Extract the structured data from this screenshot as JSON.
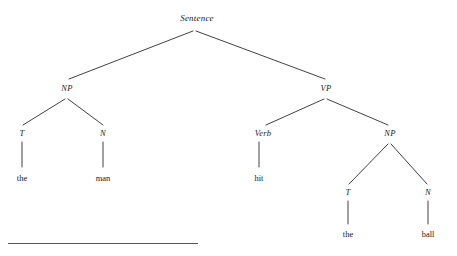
{
  "diagram": {
    "type": "syntax-tree",
    "title_node": "Sentence",
    "background_color": "#ffffff",
    "line_color": "#2b2b2b",
    "text_color": "#1a1a1a",
    "sentence_text": "the man hit the ball",
    "nodes": [
      {
        "id": "sentence",
        "label": "Sentence",
        "x": 197,
        "y": 18,
        "kind": "nonterminal"
      },
      {
        "id": "np1",
        "label": "NP",
        "x": 67,
        "y": 88,
        "kind": "nonterminal"
      },
      {
        "id": "vp",
        "label": "VP",
        "x": 326,
        "y": 88,
        "kind": "nonterminal"
      },
      {
        "id": "t1",
        "label": "T",
        "x": 22,
        "y": 133,
        "kind": "nonterminal"
      },
      {
        "id": "n1",
        "label": "N",
        "x": 103,
        "y": 133,
        "kind": "nonterminal"
      },
      {
        "id": "verb",
        "label": "Verb",
        "x": 263,
        "y": 133,
        "kind": "nonterminal"
      },
      {
        "id": "np2",
        "label": "NP",
        "x": 390,
        "y": 133,
        "kind": "nonterminal"
      },
      {
        "id": "t2",
        "label": "T",
        "x": 348,
        "y": 192,
        "kind": "nonterminal"
      },
      {
        "id": "n2",
        "label": "N",
        "x": 428,
        "y": 192,
        "kind": "nonterminal"
      }
    ],
    "terminals": [
      {
        "id": "word-the-1",
        "label": "the",
        "x": 22,
        "y": 178
      },
      {
        "id": "word-man",
        "label": "man",
        "x": 103,
        "y": 178
      },
      {
        "id": "word-hit",
        "label": "hit",
        "x": 259,
        "y": 178
      },
      {
        "id": "word-the-2",
        "label": "the",
        "x": 348,
        "y": 234
      },
      {
        "id": "word-ball",
        "label": "ball",
        "x": 428,
        "y": 234
      }
    ],
    "edges": [
      {
        "from": "sentence",
        "to": "np1",
        "x1": 193,
        "y1": 31,
        "x2": 69,
        "y2": 79
      },
      {
        "from": "sentence",
        "to": "vp",
        "x1": 196,
        "y1": 31,
        "x2": 325,
        "y2": 79
      },
      {
        "from": "np1",
        "to": "t1",
        "x1": 65,
        "y1": 99,
        "x2": 23,
        "y2": 125
      },
      {
        "from": "np1",
        "to": "n1",
        "x1": 68,
        "y1": 99,
        "x2": 103,
        "y2": 125
      },
      {
        "from": "vp",
        "to": "verb",
        "x1": 324,
        "y1": 99,
        "x2": 266,
        "y2": 125
      },
      {
        "from": "vp",
        "to": "np2",
        "x1": 327,
        "y1": 99,
        "x2": 388,
        "y2": 125
      },
      {
        "from": "np2",
        "to": "t2",
        "x1": 388,
        "y1": 144,
        "x2": 349,
        "y2": 184
      },
      {
        "from": "np2",
        "to": "n2",
        "x1": 391,
        "y1": 144,
        "x2": 427,
        "y2": 184
      }
    ],
    "stems": [
      {
        "from": "t1",
        "to": "word-the-1",
        "x": 22,
        "y1": 142,
        "y2": 167
      },
      {
        "from": "n1",
        "to": "word-man",
        "x": 103,
        "y1": 142,
        "y2": 167
      },
      {
        "from": "verb",
        "to": "word-hit",
        "x": 259,
        "y1": 142,
        "y2": 167
      },
      {
        "from": "t2",
        "to": "word-the-2",
        "x": 348,
        "y1": 201,
        "y2": 224
      },
      {
        "from": "n2",
        "to": "word-ball",
        "x": 428,
        "y1": 201,
        "y2": 224
      }
    ],
    "footnote_rule": {
      "x": 8,
      "y": 243,
      "width": 190
    }
  }
}
